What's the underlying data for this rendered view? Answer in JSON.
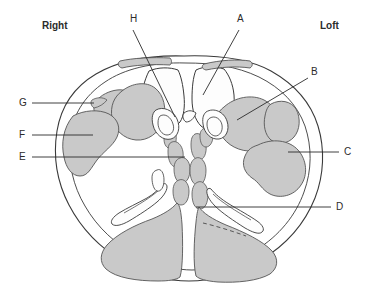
{
  "figure": {
    "type": "anatomical-cross-section",
    "view": "axial-transverse-skull-base",
    "background_color": "#ffffff",
    "outline_color": "#3a3a3a",
    "shade_fill_color": "#c9c9c9",
    "shade_stroke_color": "#555555",
    "unshaded_fill_color": "#fdfdfd",
    "leader_line_color": "#2b2b2b",
    "label_text_color": "#2b2b2b"
  },
  "orientation": {
    "right_label": "Right",
    "left_label": "Loft"
  },
  "labels": [
    {
      "id": "A",
      "text": "A",
      "x": 237,
      "y": 18,
      "leader_from": [
        239,
        30
      ],
      "leader_to": [
        203,
        95
      ]
    },
    {
      "id": "B",
      "text": "B",
      "x": 311,
      "y": 71,
      "leader_from": [
        308,
        78
      ],
      "leader_to": [
        237,
        120
      ]
    },
    {
      "id": "C",
      "text": "C",
      "x": 344,
      "y": 148,
      "leader_from": [
        339,
        152
      ],
      "leader_to": [
        288,
        152
      ]
    },
    {
      "id": "D",
      "text": "D",
      "x": 336,
      "y": 203,
      "leader_from": [
        331,
        207
      ],
      "leader_to": [
        196,
        207
      ]
    },
    {
      "id": "E",
      "text": "E",
      "x": 22,
      "y": 153,
      "leader_from": [
        32,
        157
      ],
      "leader_to": [
        185,
        157
      ]
    },
    {
      "id": "F",
      "text": "F",
      "x": 22,
      "y": 131,
      "leader_from": [
        32,
        135
      ],
      "leader_to": [
        93,
        135
      ]
    },
    {
      "id": "G",
      "text": "G",
      "x": 22,
      "y": 99,
      "leader_from": [
        32,
        103
      ],
      "leader_to": [
        94,
        103
      ]
    },
    {
      "id": "H",
      "text": "H",
      "x": 131,
      "y": 18,
      "leader_from": [
        133,
        30
      ],
      "leader_to": [
        175,
        117
      ]
    }
  ]
}
